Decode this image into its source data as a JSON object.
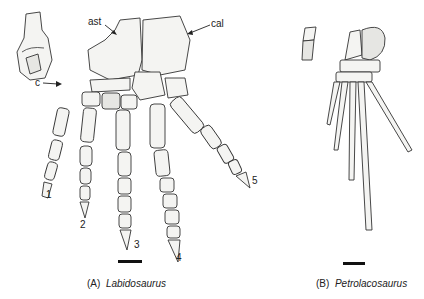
{
  "figure": {
    "panel_a": {
      "letter": "(A)",
      "taxon": "Labidosaurus",
      "labels": {
        "astragalus": "ast",
        "calcaneum": "cal",
        "centrale": "c"
      },
      "digits": [
        "1",
        "2",
        "3",
        "4",
        "5"
      ],
      "has_scale_bar": true,
      "has_inset_bone": true
    },
    "panel_b": {
      "letter": "(B)",
      "taxon": "Petrolacosaurus",
      "has_scale_bar": true,
      "has_inset_bone": true
    },
    "colors": {
      "ink": "#222222",
      "bone_fill": "#f4f4f2",
      "background": "#ffffff"
    }
  }
}
